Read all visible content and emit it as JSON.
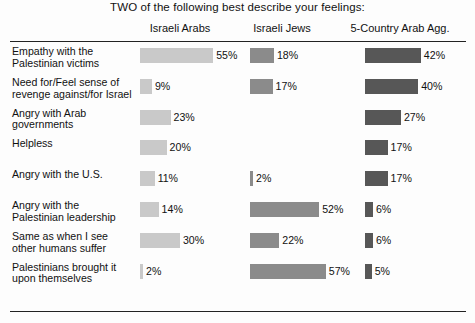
{
  "title": "TWO of the following best describe your feelings:",
  "columns": [
    {
      "label": "Israeli Arabs",
      "color": "#c9c9c9"
    },
    {
      "label": "Israeli Jews",
      "color": "#8b8b8b"
    },
    {
      "label": "5-Country Arab Agg.",
      "color": "#575757"
    }
  ],
  "rows": [
    {
      "label": "Empathy with the Palestinian victims"
    },
    {
      "label": "Need for/Feel sense of revenge against/for Israel"
    },
    {
      "label": "Angry with Arab governments"
    },
    {
      "label": "Helpless"
    },
    {
      "label": "Angry with the U.S."
    },
    {
      "label": "Angry with the Palestinian leadership"
    },
    {
      "label": "Same as when I see other humans suffer"
    },
    {
      "label": "Palestinians brought it upon themselves"
    }
  ],
  "values": {
    "r0": {
      "c0": "55%",
      "c1": "18%",
      "c2": "42%"
    },
    "r1": {
      "c0": "9%",
      "c1": "17%",
      "c2": "40%"
    },
    "r2": {
      "c0": "23%",
      "c1": "",
      "c2": "27%"
    },
    "r3": {
      "c0": "20%",
      "c1": "",
      "c2": "17%"
    },
    "r4": {
      "c0": "11%",
      "c1": "2%",
      "c2": "17%"
    },
    "r5": {
      "c0": "14%",
      "c1": "52%",
      "c2": "6%"
    },
    "r6": {
      "c0": "30%",
      "c1": "22%",
      "c2": "6%"
    },
    "r7": {
      "c0": "2%",
      "c1": "57%",
      "c2": "5%"
    }
  },
  "chart_data": {
    "type": "bar",
    "title": "TWO of the following best describe your feelings:",
    "orientation": "horizontal",
    "xlabel": "",
    "ylabel": "",
    "unit": "percent",
    "grid": false,
    "legend": "column-headers",
    "categories": [
      "Empathy with the Palestinian victims",
      "Need for/Feel sense of revenge against/for Israel",
      "Angry with Arab governments",
      "Helpless",
      "Angry with the U.S.",
      "Angry with the Palestinian leadership",
      "Same as when I see other humans suffer",
      "Palestinians brought it upon themselves"
    ],
    "series": [
      {
        "name": "Israeli Arabs",
        "color": "#c9c9c9",
        "values": [
          55,
          9,
          23,
          20,
          11,
          14,
          30,
          2
        ]
      },
      {
        "name": "Israeli Jews",
        "color": "#8b8b8b",
        "values": [
          18,
          17,
          null,
          null,
          2,
          52,
          22,
          57
        ]
      },
      {
        "name": "5-Country Arab Agg.",
        "color": "#575757",
        "values": [
          42,
          40,
          27,
          17,
          17,
          6,
          6,
          5
        ]
      }
    ],
    "xlim": [
      0,
      60
    ]
  }
}
